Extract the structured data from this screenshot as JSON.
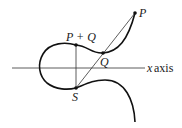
{
  "diagram": {
    "type": "elliptic-curve-point-addition",
    "labels": {
      "p": "P",
      "q": "Q",
      "sum": "P + Q",
      "s": "S",
      "axis": "x axis",
      "axis_var": "x",
      "axis_word": "axis"
    },
    "colors": {
      "curve": "#111111",
      "line": "#333333",
      "text": "#1a1a1a"
    }
  }
}
